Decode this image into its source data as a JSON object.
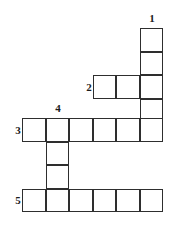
{
  "puzzle": {
    "type": "crossword-grid",
    "cell_size": 23.5,
    "grid_color": "#2e2e2e",
    "background_color": "#ffffff",
    "canvas": {
      "width": 177,
      "height": 231
    },
    "clue_numbers": [
      {
        "label": "1",
        "x": 146,
        "y": 13,
        "entry": "1-down"
      },
      {
        "label": "2",
        "x": 83,
        "y": 82,
        "entry": "2-across"
      },
      {
        "label": "3",
        "x": 12,
        "y": 125,
        "entry": "3-across"
      },
      {
        "label": "4",
        "x": 52,
        "y": 103,
        "entry": "4-down"
      },
      {
        "label": "5",
        "x": 12,
        "y": 195,
        "entry": "5-across"
      }
    ],
    "entries": [
      {
        "number": "1",
        "direction": "down",
        "length": 5,
        "cells": [
          {
            "x": 139.5,
            "y": 28.0
          },
          {
            "x": 139.5,
            "y": 51.5
          },
          {
            "x": 139.5,
            "y": 75.0
          },
          {
            "x": 139.5,
            "y": 98.5
          },
          {
            "x": 139.5,
            "y": 118.0
          }
        ]
      },
      {
        "number": "2",
        "direction": "across",
        "length": 3,
        "cells": [
          {
            "x": 92.5,
            "y": 75.0
          },
          {
            "x": 116.0,
            "y": 75.0
          },
          {
            "x": 139.5,
            "y": 75.0
          }
        ]
      },
      {
        "number": "3",
        "direction": "across",
        "length": 6,
        "cells": [
          {
            "x": 22.0,
            "y": 118.0
          },
          {
            "x": 45.5,
            "y": 118.0
          },
          {
            "x": 69.0,
            "y": 118.0
          },
          {
            "x": 92.5,
            "y": 118.0
          },
          {
            "x": 116.0,
            "y": 118.0
          },
          {
            "x": 139.5,
            "y": 118.0
          }
        ]
      },
      {
        "number": "4",
        "direction": "down",
        "length": 4,
        "cells": [
          {
            "x": 45.5,
            "y": 118.0
          },
          {
            "x": 45.5,
            "y": 141.5
          },
          {
            "x": 45.5,
            "y": 165.0
          },
          {
            "x": 45.5,
            "y": 188.5
          }
        ]
      },
      {
        "number": "5",
        "direction": "across",
        "length": 6,
        "cells": [
          {
            "x": 22.0,
            "y": 188.5
          },
          {
            "x": 45.5,
            "y": 188.5
          },
          {
            "x": 69.0,
            "y": 188.5
          },
          {
            "x": 92.5,
            "y": 188.5
          },
          {
            "x": 116.0,
            "y": 188.5
          },
          {
            "x": 139.5,
            "y": 188.5
          }
        ]
      }
    ],
    "cells": [
      {
        "x": 139.5,
        "y": 28.0,
        "name": "cell-r1-c6"
      },
      {
        "x": 139.5,
        "y": 51.5,
        "name": "cell-r2-c6"
      },
      {
        "x": 92.5,
        "y": 75.0,
        "name": "cell-r3-c4"
      },
      {
        "x": 116.0,
        "y": 75.0,
        "name": "cell-r3-c5"
      },
      {
        "x": 139.5,
        "y": 75.0,
        "name": "cell-r3-c6"
      },
      {
        "x": 139.5,
        "y": 98.5,
        "name": "cell-r4-c6"
      },
      {
        "x": 22.0,
        "y": 118.0,
        "name": "cell-r5-c1"
      },
      {
        "x": 45.5,
        "y": 118.0,
        "name": "cell-r5-c2"
      },
      {
        "x": 69.0,
        "y": 118.0,
        "name": "cell-r5-c3"
      },
      {
        "x": 92.5,
        "y": 118.0,
        "name": "cell-r5-c4"
      },
      {
        "x": 116.0,
        "y": 118.0,
        "name": "cell-r5-c5"
      },
      {
        "x": 139.5,
        "y": 118.0,
        "name": "cell-r5-c6"
      },
      {
        "x": 45.5,
        "y": 141.5,
        "name": "cell-r6-c2"
      },
      {
        "x": 45.5,
        "y": 165.0,
        "name": "cell-r7-c2"
      },
      {
        "x": 22.0,
        "y": 188.5,
        "name": "cell-r8-c1"
      },
      {
        "x": 45.5,
        "y": 188.5,
        "name": "cell-r8-c2"
      },
      {
        "x": 69.0,
        "y": 188.5,
        "name": "cell-r8-c3"
      },
      {
        "x": 92.5,
        "y": 188.5,
        "name": "cell-r8-c4"
      },
      {
        "x": 116.0,
        "y": 188.5,
        "name": "cell-r8-c5"
      },
      {
        "x": 139.5,
        "y": 188.5,
        "name": "cell-r8-c6"
      }
    ]
  }
}
